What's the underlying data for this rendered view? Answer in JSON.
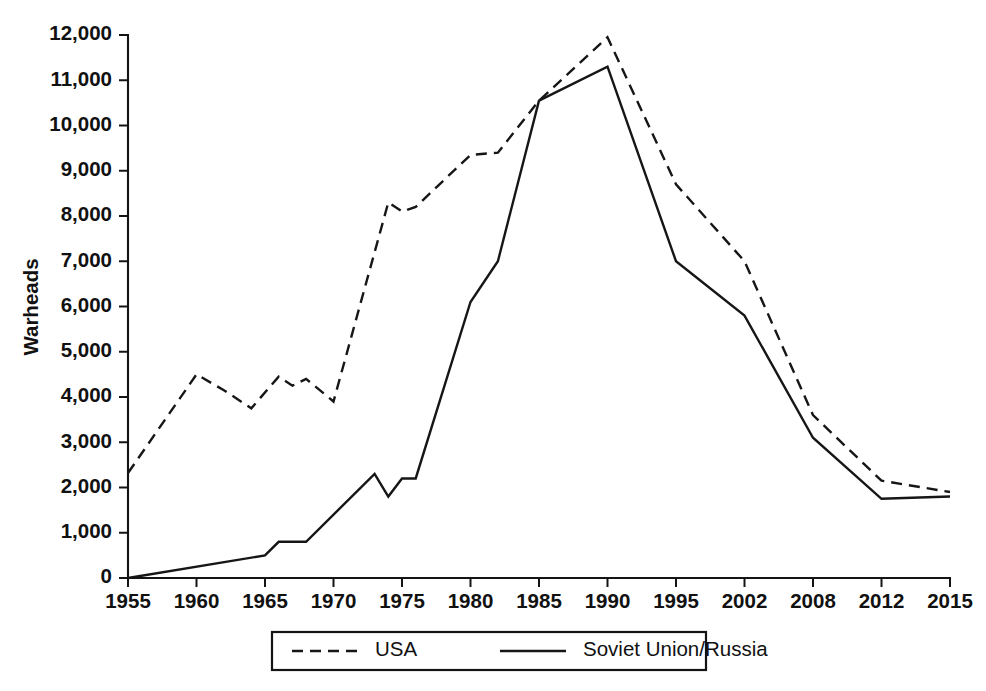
{
  "chart_data": {
    "type": "line",
    "title": "",
    "xlabel": "",
    "ylabel": "Warheads",
    "ylim": [
      0,
      12000
    ],
    "ytick_labels": [
      "0",
      "1,000",
      "2,000",
      "3,000",
      "4,000",
      "5,000",
      "6,000",
      "7,000",
      "8,000",
      "9,000",
      "10,000",
      "11,000",
      "12,000"
    ],
    "ytick_values": [
      0,
      1000,
      2000,
      3000,
      4000,
      5000,
      6000,
      7000,
      8000,
      9000,
      10000,
      11000,
      12000
    ],
    "categories": [
      "1955",
      "1960",
      "1965",
      "1970",
      "1975",
      "1980",
      "1985",
      "1990",
      "1995",
      "2002",
      "2008",
      "2012",
      "2015"
    ],
    "grid": false,
    "legend_position": "bottom",
    "axis_note": "x-axis is categorical with evenly spaced labeled ticks; intermediate yearly vertices occur between labeled ticks",
    "series": [
      {
        "name": "USA",
        "line_style": "dashed",
        "points": [
          {
            "year": 1955,
            "value": 2320
          },
          {
            "year": 1960,
            "value": 4500
          },
          {
            "year": 1962,
            "value": 4150
          },
          {
            "year": 1964,
            "value": 3750
          },
          {
            "year": 1966,
            "value": 4450
          },
          {
            "year": 1967,
            "value": 4250
          },
          {
            "year": 1968,
            "value": 4400
          },
          {
            "year": 1970,
            "value": 3900
          },
          {
            "year": 1974,
            "value": 8300
          },
          {
            "year": 1975,
            "value": 8100
          },
          {
            "year": 1976,
            "value": 8200
          },
          {
            "year": 1980,
            "value": 9350
          },
          {
            "year": 1982,
            "value": 9400
          },
          {
            "year": 1985,
            "value": 10550
          },
          {
            "year": 1990,
            "value": 11950
          },
          {
            "year": 1995,
            "value": 8700
          },
          {
            "year": 2002,
            "value": 7000
          },
          {
            "year": 2008,
            "value": 3600
          },
          {
            "year": 2012,
            "value": 2150
          },
          {
            "year": 2015,
            "value": 1900
          }
        ]
      },
      {
        "name": "Soviet Union/Russia",
        "line_style": "solid",
        "points": [
          {
            "year": 1955,
            "value": 0
          },
          {
            "year": 1965,
            "value": 500
          },
          {
            "year": 1966,
            "value": 800
          },
          {
            "year": 1968,
            "value": 800
          },
          {
            "year": 1973,
            "value": 2300
          },
          {
            "year": 1974,
            "value": 1800
          },
          {
            "year": 1975,
            "value": 2200
          },
          {
            "year": 1976,
            "value": 2200
          },
          {
            "year": 1980,
            "value": 6100
          },
          {
            "year": 1982,
            "value": 7000
          },
          {
            "year": 1985,
            "value": 10550
          },
          {
            "year": 1990,
            "value": 11300
          },
          {
            "year": 1995,
            "value": 7000
          },
          {
            "year": 2002,
            "value": 5800
          },
          {
            "year": 2008,
            "value": 3100
          },
          {
            "year": 2012,
            "value": 1750
          },
          {
            "year": 2015,
            "value": 1800
          }
        ]
      }
    ],
    "legend": [
      {
        "label": "USA",
        "line_style": "dashed"
      },
      {
        "label": "Soviet Union/Russia",
        "line_style": "solid"
      }
    ],
    "colors": {
      "line": "#161616",
      "axis": "#141414",
      "text": "#111111",
      "background": "#ffffff"
    }
  }
}
